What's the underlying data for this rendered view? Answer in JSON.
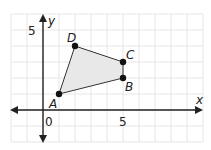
{
  "diagram": {
    "type": "coordinate-plane-polygon",
    "axes": {
      "x_label": "x",
      "y_label": "y",
      "origin_label": "0",
      "x_tick_label": "5",
      "y_tick_label": "5",
      "x_range": [
        -2,
        10
      ],
      "y_range": [
        -2,
        6
      ]
    },
    "grid": {
      "spacing_units": 1,
      "color": "#e6e6e6"
    },
    "polygon": {
      "fill": "#e8e8e8",
      "stroke": "#333333",
      "vertices": [
        {
          "label": "A",
          "x": 1,
          "y": 1
        },
        {
          "label": "B",
          "x": 5,
          "y": 2
        },
        {
          "label": "C",
          "x": 5,
          "y": 3
        },
        {
          "label": "D",
          "x": 2,
          "y": 4
        }
      ]
    }
  }
}
